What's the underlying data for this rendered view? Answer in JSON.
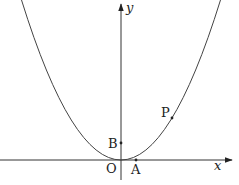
{
  "diagram": {
    "type": "coordinate-plane-parabola",
    "axes": {
      "x_label": "x",
      "y_label": "y",
      "origin_label": "O"
    },
    "curve": {
      "name": "parabola",
      "description": "upward-opening parabola with vertex at origin"
    },
    "points": [
      {
        "id": "A",
        "label": "A",
        "location": "on x-axis, right of origin"
      },
      {
        "id": "B",
        "label": "B",
        "location": "on y-axis, above origin"
      },
      {
        "id": "P",
        "label": "P",
        "location": "on parabola, first quadrant"
      }
    ],
    "colors": {
      "stroke": "#333333",
      "background": "#ffffff"
    }
  }
}
